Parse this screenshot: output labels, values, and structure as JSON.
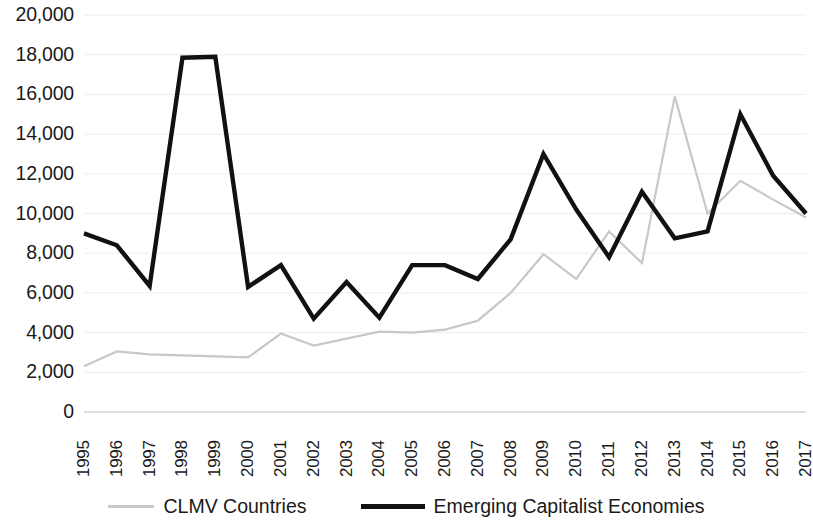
{
  "chart_data": {
    "type": "line",
    "title": "",
    "xlabel": "",
    "ylabel": "",
    "grid": true,
    "legend_position": "bottom",
    "ylim": [
      0,
      20000
    ],
    "ytick_step": 2000,
    "ytick_labels": [
      "20,000",
      "18,000",
      "16,000",
      "14,000",
      "12,000",
      "10,000",
      "8,000",
      "6,000",
      "4,000",
      "2,000",
      "0"
    ],
    "ytick_values": [
      20000,
      18000,
      16000,
      14000,
      12000,
      10000,
      8000,
      6000,
      4000,
      2000,
      0
    ],
    "categories": [
      "1995",
      "1996",
      "1997",
      "1998",
      "1999",
      "2000",
      "2001",
      "2002",
      "2003",
      "2004",
      "2005",
      "2006",
      "2007",
      "2008",
      "2009",
      "2010",
      "2011",
      "2012",
      "2013",
      "2014",
      "2015",
      "2016",
      "2017"
    ],
    "x": [
      1995,
      1996,
      1997,
      1998,
      1999,
      2000,
      2001,
      2002,
      2003,
      2004,
      2005,
      2006,
      2007,
      2008,
      2009,
      2010,
      2011,
      2012,
      2013,
      2014,
      2015,
      2016,
      2017
    ],
    "series": [
      {
        "name": "CLMV Countries",
        "color": "#c8c8c8",
        "line_width": 2.2,
        "values": [
          2300,
          3050,
          2900,
          2850,
          2800,
          2750,
          3950,
          3350,
          3700,
          4050,
          4000,
          4150,
          4600,
          6000,
          7950,
          6700,
          9100,
          7500,
          15900,
          10000,
          11650,
          10700,
          9800
        ]
      },
      {
        "name": "Emerging Capitalist Economies",
        "color": "#111111",
        "line_width": 4.4,
        "values": [
          9000,
          8400,
          6350,
          17850,
          17900,
          6300,
          7400,
          4700,
          6550,
          4750,
          7400,
          7400,
          6700,
          8700,
          13000,
          10200,
          7800,
          11100,
          8750,
          9100,
          15000,
          11900,
          10000
        ]
      }
    ]
  },
  "legend": {
    "items": [
      {
        "label": "CLMV Countries",
        "marker": "dotted-line-marker"
      },
      {
        "label": "Emerging Capitalist Economies",
        "marker": "solid-line-marker"
      }
    ]
  }
}
